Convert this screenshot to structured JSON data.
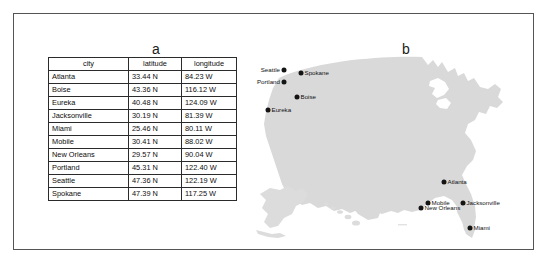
{
  "figure": {
    "panels": [
      {
        "id": "a",
        "label": "a"
      },
      {
        "id": "b",
        "label": "b"
      }
    ]
  },
  "table": {
    "headers": [
      "city",
      "latitude",
      "longitude"
    ],
    "rows": [
      {
        "city": "Atlanta",
        "latitude": "33.44 N",
        "longitude": "84.23 W"
      },
      {
        "city": "Boise",
        "latitude": "43.36 N",
        "longitude": "116.12 W"
      },
      {
        "city": "Eureka",
        "latitude": "40.48 N",
        "longitude": "124.09 W"
      },
      {
        "city": "Jacksonville",
        "latitude": "30.19 N",
        "longitude": "81.39 W"
      },
      {
        "city": "Miami",
        "latitude": "25.46 N",
        "longitude": "80.11 W"
      },
      {
        "city": "Mobile",
        "latitude": "30.41 N",
        "longitude": "88.02 W"
      },
      {
        "city": "New Orleans",
        "latitude": "29.57 N",
        "longitude": "90.04 W"
      },
      {
        "city": "Portland",
        "latitude": "45.31 N",
        "longitude": "122.40 W"
      },
      {
        "city": "Seattle",
        "latitude": "47.36 N",
        "longitude": "122.19 W"
      },
      {
        "city": "Spokane",
        "latitude": "47.39 N",
        "longitude": "117.25 W"
      }
    ]
  },
  "map": {
    "land_color": "#d9d9d9",
    "dot_color": "#141414",
    "markers": [
      {
        "name": "Seattle",
        "label": "Seattle",
        "x": 32,
        "y": 22,
        "side": "left"
      },
      {
        "name": "Portland",
        "label": "Portland",
        "x": 32,
        "y": 34,
        "side": "left"
      },
      {
        "name": "Spokane",
        "label": "Spokane",
        "x": 49,
        "y": 25,
        "side": "right"
      },
      {
        "name": "Boise",
        "label": "Boise",
        "x": 45,
        "y": 49,
        "side": "right"
      },
      {
        "name": "Eureka",
        "label": "Eureka",
        "x": 16,
        "y": 62,
        "side": "right"
      },
      {
        "name": "Atlanta",
        "label": "Atlanta",
        "x": 192,
        "y": 134,
        "side": "right"
      },
      {
        "name": "Mobile",
        "label": "Mobile",
        "x": 176,
        "y": 155,
        "side": "right"
      },
      {
        "name": "New Orleans",
        "label": "New Orleans",
        "x": 169,
        "y": 160,
        "side": "right"
      },
      {
        "name": "Jacksonville",
        "label": "Jacksonville",
        "x": 211,
        "y": 155,
        "side": "right"
      },
      {
        "name": "Miami",
        "label": "Miami",
        "x": 218,
        "y": 180,
        "side": "right"
      }
    ]
  }
}
